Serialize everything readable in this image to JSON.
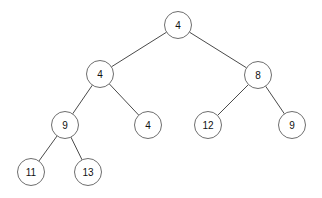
{
  "diagram": {
    "type": "binary-tree",
    "background_color": "#ffffff",
    "node_fill_color": "#ffffff",
    "node_stroke_color": "#6e6e6e",
    "edge_color": "#4a4a4a",
    "label_color": "#111111",
    "node_radius": 13.5,
    "canvas": {
      "width": 322,
      "height": 198
    },
    "nodes": [
      {
        "id": "n0",
        "label": "4",
        "x": 178,
        "y": 25,
        "level": 0
      },
      {
        "id": "n1",
        "label": "4",
        "x": 100,
        "y": 74,
        "level": 1
      },
      {
        "id": "n2",
        "label": "8",
        "x": 258,
        "y": 75,
        "level": 1
      },
      {
        "id": "n3",
        "label": "9",
        "x": 65,
        "y": 125,
        "level": 2
      },
      {
        "id": "n4",
        "label": "4",
        "x": 148,
        "y": 125,
        "level": 2
      },
      {
        "id": "n5",
        "label": "12",
        "x": 208,
        "y": 125,
        "level": 2
      },
      {
        "id": "n6",
        "label": "9",
        "x": 292,
        "y": 125,
        "level": 2
      },
      {
        "id": "n7",
        "label": "11",
        "x": 31,
        "y": 172,
        "level": 3
      },
      {
        "id": "n8",
        "label": "13",
        "x": 88,
        "y": 172,
        "level": 3
      }
    ],
    "edges": [
      {
        "from": "n0",
        "to": "n1",
        "side": "left"
      },
      {
        "from": "n0",
        "to": "n2",
        "side": "right"
      },
      {
        "from": "n1",
        "to": "n3",
        "side": "left"
      },
      {
        "from": "n1",
        "to": "n4",
        "side": "right"
      },
      {
        "from": "n2",
        "to": "n5",
        "side": "left"
      },
      {
        "from": "n2",
        "to": "n6",
        "side": "right"
      },
      {
        "from": "n3",
        "to": "n7",
        "side": "left"
      },
      {
        "from": "n3",
        "to": "n8",
        "side": "right"
      }
    ]
  }
}
